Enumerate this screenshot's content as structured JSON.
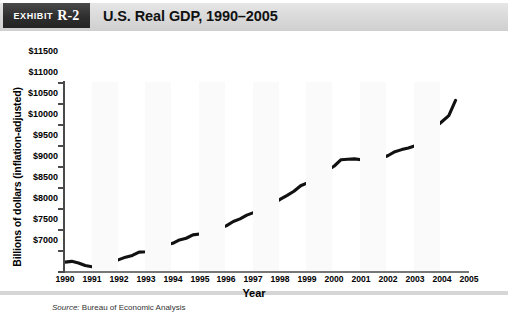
{
  "header": {
    "exhibit_word": "EXHIBIT",
    "exhibit_number": "R-2",
    "title": "U.S. Real GDP, 1990–2005"
  },
  "source": {
    "label": "Source:",
    "text": " Bureau of Economic Analysis"
  },
  "colors": {
    "header_band": "#dcdcdc",
    "exhibit_box": "#2e2e2e",
    "line": "#111111",
    "axis": "#4a4a4a",
    "panel_border": "#d6d6d6"
  },
  "chart_data": {
    "type": "line",
    "title": "U.S. Real GDP, 1990–2005",
    "xlabel": "Year",
    "ylabel": "Billions of dollars (inflation-adjusted)",
    "xlim": [
      1990,
      2005
    ],
    "ylim": [
      7000,
      11500
    ],
    "ytick_labels": [
      "$11500",
      "$11000",
      "$10500",
      "$10000",
      "$9500",
      "$9000",
      "$8500",
      "$8000",
      "$7500",
      "$7000"
    ],
    "ytick_values": [
      11500,
      11000,
      10500,
      10000,
      9500,
      9000,
      8500,
      8000,
      7500,
      7000
    ],
    "xtick_labels": [
      "1990",
      "1991",
      "1992",
      "1993",
      "1994",
      "1995",
      "1996",
      "1997",
      "1998",
      "1999",
      "2000",
      "2001",
      "2002",
      "2003",
      "2004",
      "2005"
    ],
    "xtick_values": [
      1990,
      1991,
      1992,
      1993,
      1994,
      1995,
      1996,
      1997,
      1998,
      1999,
      2000,
      2001,
      2002,
      2003,
      2004,
      2005
    ],
    "grid": false,
    "legend": "none",
    "series": [
      {
        "name": "U.S. Real GDP (inflation-adjusted, billions of dollars)",
        "x": [
          1990.0,
          1990.25,
          1990.5,
          1990.75,
          1991.0,
          1991.25,
          1991.5,
          1991.75,
          1992.0,
          1992.25,
          1992.5,
          1992.75,
          1993.0,
          1993.25,
          1993.5,
          1993.75,
          1994.0,
          1994.25,
          1994.5,
          1994.75,
          1995.0,
          1995.25,
          1995.5,
          1995.75,
          1996.0,
          1996.25,
          1996.5,
          1996.75,
          1997.0,
          1997.25,
          1997.5,
          1997.75,
          1998.0,
          1998.25,
          1998.5,
          1998.75,
          1999.0,
          1999.25,
          1999.5,
          1999.75,
          2000.0,
          2000.25,
          2000.5,
          2000.75,
          2001.0,
          2001.25,
          2001.5,
          2001.75,
          2002.0,
          2002.25,
          2002.5,
          2002.75,
          2003.0,
          2003.25,
          2003.5,
          2003.75,
          2004.0,
          2004.25,
          2004.5
        ],
        "values": [
          7210,
          7230,
          7190,
          7130,
          7100,
          7130,
          7180,
          7210,
          7270,
          7330,
          7370,
          7450,
          7460,
          7490,
          7540,
          7620,
          7660,
          7740,
          7780,
          7860,
          7880,
          7900,
          7960,
          8010,
          8080,
          8180,
          8240,
          8330,
          8390,
          8490,
          8550,
          8610,
          8710,
          8800,
          8900,
          9030,
          9100,
          9170,
          9280,
          9400,
          9500,
          9650,
          9660,
          9670,
          9650,
          9660,
          9700,
          9680,
          9750,
          9840,
          9890,
          9930,
          9980,
          10120,
          10290,
          10420,
          10560,
          10700,
          11060
        ]
      }
    ],
    "annotations": [
      {
        "text": "Early-1990s recession trough near 1991",
        "x": 1991.0,
        "y": 7100
      },
      {
        "text": "Flat plateau during 2000–2001 slowdown",
        "x": 2000.6,
        "y": 9670
      }
    ]
  }
}
